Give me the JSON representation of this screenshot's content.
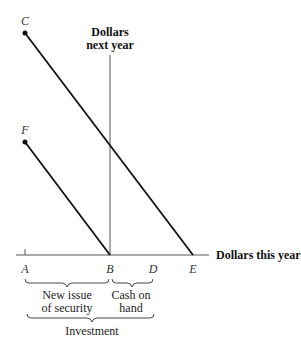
{
  "diagram": {
    "axes": {
      "y_label_line1": "Dollars",
      "y_label_line2": "next year",
      "x_label": "Dollars this year"
    },
    "points": {
      "C": "C",
      "F": "F",
      "A": "A",
      "B": "B",
      "D": "D",
      "E": "E"
    },
    "braces": {
      "new_issue_line1": "New issue",
      "new_issue_line2": "of security",
      "cash_line1": "Cash on",
      "cash_line2": "hand",
      "investment": "Investment"
    },
    "lines": [
      {
        "name": "line-CE",
        "from": "C",
        "to": "E"
      },
      {
        "name": "line-FB",
        "from": "F",
        "to": "B"
      }
    ]
  }
}
